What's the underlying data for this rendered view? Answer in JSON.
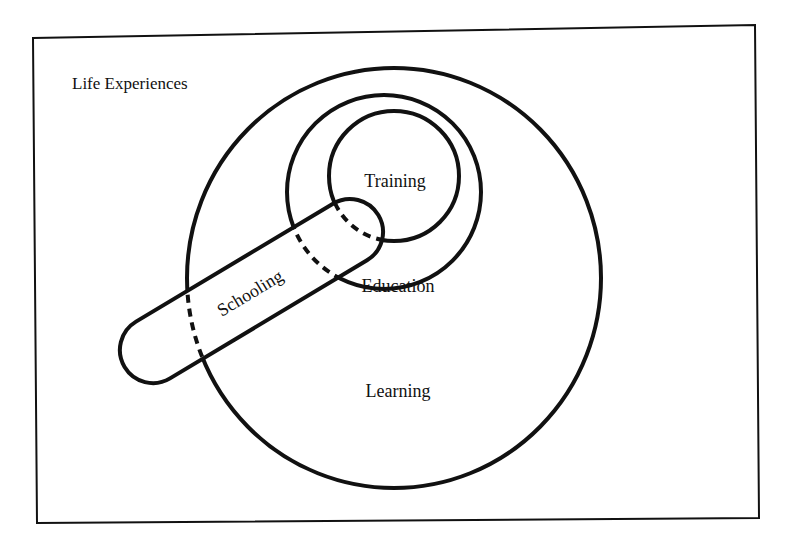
{
  "diagram": {
    "type": "nested-venn",
    "frame_label": "Life Experiences",
    "regions": {
      "learning": "Learning",
      "education": "Education",
      "training": "Training",
      "schooling": "Schooling"
    },
    "colors": {
      "stroke": "#111111",
      "background": "#ffffff"
    }
  }
}
